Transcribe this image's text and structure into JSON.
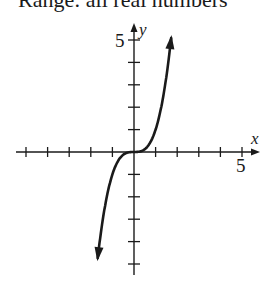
{
  "caption": "Range: all real numbers",
  "chart_data": {
    "type": "line",
    "title": "",
    "function": "y = x^3",
    "xlabel": "x",
    "ylabel": "y",
    "xlim": [
      -5,
      5
    ],
    "ylim": [
      -5,
      5
    ],
    "x_ticks": [
      -5,
      -4,
      -3,
      -2,
      -1,
      1,
      2,
      3,
      4,
      5
    ],
    "y_ticks": [
      -5,
      -4,
      -3,
      -2,
      -1,
      1,
      2,
      3,
      4,
      5
    ],
    "tick_labels": {
      "x": [
        "5"
      ],
      "y": [
        "5"
      ]
    },
    "x_tick_label": "5",
    "y_tick_label": "5",
    "grid": false,
    "arrows_on_curve": true,
    "series": [
      {
        "name": "y = x^3",
        "x": [
          -1.75,
          -1.5,
          -1.25,
          -1,
          -0.75,
          -0.5,
          -0.25,
          0,
          0.25,
          0.5,
          0.75,
          1,
          1.25,
          1.5,
          1.75
        ],
        "y": [
          -5.36,
          -3.38,
          -1.95,
          -1,
          -0.42,
          -0.125,
          -0.016,
          0,
          0.016,
          0.125,
          0.42,
          1,
          1.95,
          3.38,
          5.36
        ]
      }
    ]
  }
}
